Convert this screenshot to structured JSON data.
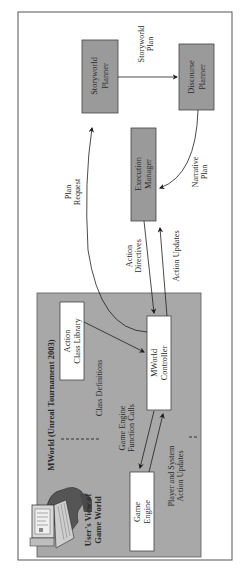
{
  "diagram": {
    "orientation": "rotated-90-ccw",
    "colors": {
      "frame_border": "#555555",
      "gray_box_fill": "#9a9a9a",
      "gray_region_fill": "#a8a8a8",
      "white_box_fill": "#ffffff",
      "line": "#1e1e1e"
    },
    "nodes": {
      "storyworld_planner": {
        "line1": "Storyworld",
        "line2": "Planner"
      },
      "discourse_planner": {
        "line1": "Discourse",
        "line2": "Planner"
      },
      "execution_manager": {
        "line1": "Execution",
        "line2": "Manager"
      },
      "action_class_library": {
        "line1": "Action",
        "line2": "Class Library"
      },
      "mworld_controller": {
        "line1": "MWorld",
        "line2": "Controller"
      },
      "game_engine": {
        "line1": "Game",
        "line2": "Engine"
      }
    },
    "region": {
      "title": "MWorld (Unreal Tournament 2003)",
      "user_view_line1": "User's View of",
      "user_view_line2": "Game World",
      "user_icon": "user-at-computer-icon"
    },
    "edges": {
      "storyworld_plan": {
        "line1": "Storyworld",
        "line2": "Plan"
      },
      "narrative_plan": {
        "line1": "Narrative",
        "line2": "Plan"
      },
      "plan_request": {
        "line1": "Plan",
        "line2": "Request"
      },
      "action_directives": {
        "line1": "Action",
        "line2": "Directives"
      },
      "action_updates": {
        "line1": "Action Updates"
      },
      "class_definitions": {
        "line1": "Class Definitions"
      },
      "game_engine_calls": {
        "line1": "Game Engine",
        "line2": "Function Calls"
      },
      "player_system_updates": {
        "line1": "Player and System",
        "line2": "Action Updates"
      }
    }
  }
}
